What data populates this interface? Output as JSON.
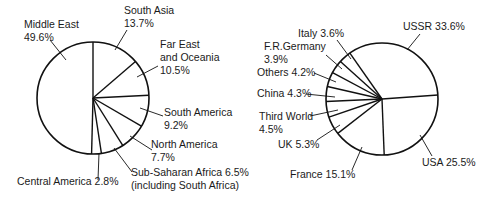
{
  "chart_data": [
    {
      "type": "pie",
      "title": "",
      "center": [
        93,
        98
      ],
      "radius": 56,
      "start_angle_deg": 0,
      "direction": "clockwise",
      "slices": [
        {
          "label": "South Asia",
          "value": 13.7,
          "label_lines": [
            "South Asia",
            "13.7%"
          ],
          "text_pos": [
            124,
            14
          ],
          "anchor_text": [
            127,
            30
          ],
          "anchor_pie": [
            115,
            50
          ]
        },
        {
          "label": "Far East and Oceania",
          "value": 10.5,
          "label_lines": [
            "Far East",
            "and Oceania",
            "10.5%"
          ],
          "text_pos": [
            160,
            48
          ],
          "anchor_text": [
            158,
            66
          ],
          "anchor_pie": [
            137,
            77
          ]
        },
        {
          "label": "South America",
          "value": 9.2,
          "label_lines": [
            "South America",
            "9.2%"
          ],
          "text_pos": [
            164,
            116
          ],
          "anchor_text": [
            163,
            116
          ],
          "anchor_pie": [
            140,
            108
          ]
        },
        {
          "label": "North America",
          "value": 7.7,
          "label_lines": [
            "North America",
            "7.7%"
          ],
          "text_pos": [
            151,
            148
          ],
          "anchor_text": [
            152,
            150
          ],
          "anchor_pie": [
            130,
            136
          ]
        },
        {
          "label": "Sub-Saharan Africa (including South Africa)",
          "value": 6.5,
          "label_lines": [
            "Sub-Saharan Africa 6.5%",
            "(including South Africa)"
          ],
          "text_pos": [
            131,
            176
          ],
          "anchor_text": [
            132,
            172
          ],
          "anchor_pie": [
            114,
            148
          ]
        },
        {
          "label": "Central America",
          "value": 2.8,
          "label_lines": [
            "Central America 2.8%"
          ],
          "text_pos": [
            17,
            185
          ],
          "anchor_text": [
            98,
            180
          ],
          "anchor_pie": [
            99,
            153
          ]
        },
        {
          "label": "Middle East",
          "value": 49.6,
          "label_lines": [
            "Middle East",
            "49.6%"
          ],
          "text_pos": [
            24,
            28
          ],
          "anchor_text": [
            50,
            40
          ],
          "anchor_pie": [
            66,
            60
          ]
        }
      ]
    },
    {
      "type": "pie",
      "title": "",
      "center": [
        382,
        99
      ],
      "radius": 56,
      "start_angle_deg": -35,
      "direction": "clockwise",
      "slices": [
        {
          "label": "USSR",
          "value": 33.6,
          "label_lines": [
            "USSR 33.6%"
          ],
          "text_pos": [
            403,
            30
          ],
          "anchor_text": [
            420,
            34
          ],
          "anchor_pie": [
            407,
            50
          ]
        },
        {
          "label": "USA",
          "value": 25.5,
          "label_lines": [
            "USA 25.5%"
          ],
          "text_pos": [
            422,
            166
          ],
          "anchor_text": [
            432,
            156
          ],
          "anchor_pie": [
            420,
            135
          ]
        },
        {
          "label": "France",
          "value": 15.1,
          "label_lines": [
            "France 15.1%"
          ],
          "text_pos": [
            290,
            178
          ],
          "anchor_text": [
            352,
            170
          ],
          "anchor_pie": [
            362,
            147
          ]
        },
        {
          "label": "UK",
          "value": 5.3,
          "label_lines": [
            "UK 5.3%"
          ],
          "text_pos": [
            278,
            148
          ],
          "anchor_text": [
            317,
            140
          ],
          "anchor_pie": [
            340,
            125
          ]
        },
        {
          "label": "Third World",
          "value": 4.5,
          "label_lines": [
            "Third World",
            "4.5%"
          ],
          "text_pos": [
            259,
            120
          ],
          "anchor_text": [
            310,
            116
          ],
          "anchor_pie": [
            338,
            110
          ]
        },
        {
          "label": "China",
          "value": 4.3,
          "label_lines": [
            "China 4.3%"
          ],
          "text_pos": [
            257,
            97
          ],
          "anchor_text": [
            306,
            94
          ],
          "anchor_pie": [
            335,
            97
          ]
        },
        {
          "label": "Others",
          "value": 4.2,
          "label_lines": [
            "Others 4.2%"
          ],
          "text_pos": [
            257,
            76
          ],
          "anchor_text": [
            314,
            73
          ],
          "anchor_pie": [
            336,
            82
          ]
        },
        {
          "label": "F.R.Germany",
          "value": 3.9,
          "label_lines": [
            "F.R.Germany",
            "3.9%"
          ],
          "text_pos": [
            264,
            50
          ],
          "anchor_text": [
            326,
            55
          ],
          "anchor_pie": [
            342,
            69
          ]
        },
        {
          "label": "Italy",
          "value": 3.6,
          "label_lines": [
            "Italy 3.6%"
          ],
          "text_pos": [
            298,
            37
          ],
          "anchor_text": [
            337,
            40
          ],
          "anchor_pie": [
            351,
            59
          ]
        }
      ]
    }
  ]
}
